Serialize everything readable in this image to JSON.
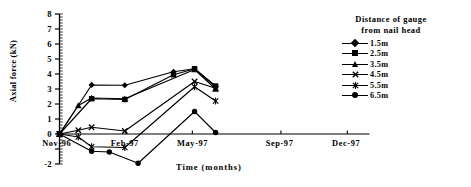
{
  "chart_data": {
    "type": "line",
    "title": "",
    "xlabel": "Time (months)",
    "ylabel": "Axial force (kN)",
    "ylim": [
      -2,
      8
    ],
    "yticks": [
      8,
      7,
      6,
      5,
      4,
      3,
      2,
      1,
      0,
      -1,
      -2
    ],
    "ytick_labels": [
      "8",
      "7",
      "6",
      "5",
      "4",
      "3",
      "2",
      "1",
      "0",
      "",
      "-2"
    ],
    "xtick_labels": [
      "Nov-96",
      "Feb-97",
      "May-97",
      "Sep-97",
      "Dec-97"
    ],
    "xtick_months": [
      0,
      3,
      6,
      10,
      13
    ],
    "x_range_months": [
      0,
      14
    ],
    "grid": false,
    "legend_position": "top-right",
    "legend_title": "Distance of gauge from nail head",
    "series": [
      {
        "name": "1.5m",
        "marker": "diamond",
        "x": [
          0,
          1.45,
          2.95,
          5.15,
          6.1,
          7.05
        ],
        "y": [
          0,
          3.27,
          3.25,
          4.15,
          4.35,
          3.15
        ]
      },
      {
        "name": "2.5m",
        "marker": "square",
        "x": [
          0,
          1.45,
          2.95,
          5.15,
          6.1,
          7.05
        ],
        "y": [
          0,
          2.35,
          2.3,
          3.95,
          4.35,
          3.2
        ]
      },
      {
        "name": "3.5m",
        "marker": "triangle",
        "x": [
          0,
          0.85,
          1.45,
          2.95,
          6.1,
          7.05
        ],
        "y": [
          0,
          1.9,
          2.4,
          2.35,
          4.3,
          3.0
        ]
      },
      {
        "name": "4.5m",
        "marker": "x",
        "x": [
          0,
          0.85,
          1.45,
          2.95,
          6.1,
          7.05
        ],
        "y": [
          0,
          0.25,
          0.45,
          0.2,
          3.5,
          3.05
        ]
      },
      {
        "name": "5.5m",
        "marker": "star",
        "x": [
          0,
          0.85,
          1.45,
          2.95,
          6.1,
          7.05
        ],
        "y": [
          0,
          -0.2,
          -0.85,
          -0.9,
          3.15,
          2.2
        ]
      },
      {
        "name": "6.5m",
        "marker": "circle",
        "x": [
          0,
          1.45,
          2.25,
          3.55,
          6.1,
          7.05
        ],
        "y": [
          0,
          -1.15,
          -1.2,
          -1.95,
          1.5,
          0.1
        ]
      }
    ]
  },
  "legend": {
    "title_line1": "Distance of gauge",
    "title_line2": "from nail head",
    "items": [
      {
        "label": "1.5m"
      },
      {
        "label": "2.5m"
      },
      {
        "label": "3.5m"
      },
      {
        "label": "4.5m"
      },
      {
        "label": "5.5m"
      },
      {
        "label": "6.5m"
      }
    ]
  },
  "axes": {
    "y_title": "Axial force (kN)",
    "x_title": "Time (months)",
    "y_labels": [
      "8",
      "7",
      "6",
      "5",
      "4",
      "3",
      "2",
      "1",
      "0",
      "-2"
    ],
    "x_labels": [
      "Nov-96",
      "Feb-97",
      "May-97",
      "Sep-97",
      "Dec-97"
    ]
  },
  "colors": {
    "ink": "#000000",
    "background": "#ffffff"
  }
}
